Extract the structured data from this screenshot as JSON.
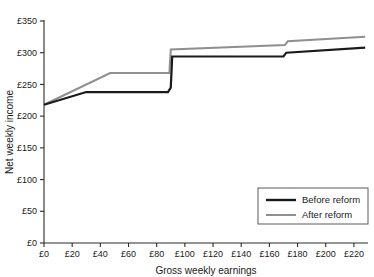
{
  "chart_data": {
    "type": "line",
    "title": "",
    "subtitle": "",
    "xlabel": "Gross weekly earnings",
    "ylabel": "Net weekly income",
    "xlim": [
      0,
      230
    ],
    "ylim": [
      0,
      350
    ],
    "grid": false,
    "legend_position": "bottom-right",
    "x_ticks": [
      0,
      20,
      40,
      60,
      80,
      100,
      120,
      140,
      160,
      180,
      200,
      220
    ],
    "x_tick_labels": [
      "£0",
      "£20",
      "£40",
      "£60",
      "£80",
      "£100",
      "£120",
      "£140",
      "£160",
      "£180",
      "£200",
      "£220"
    ],
    "y_ticks": [
      0,
      50,
      100,
      150,
      200,
      250,
      300,
      350
    ],
    "y_tick_labels": [
      "£0",
      "£50",
      "£100",
      "£150",
      "£200",
      "£250",
      "£300",
      "£350"
    ],
    "currency_symbol": "£",
    "series": [
      {
        "name": "Before reform",
        "color": "#1a1a1a",
        "width": 2.2,
        "points": [
          [
            0,
            218
          ],
          [
            30,
            238
          ],
          [
            88,
            238
          ],
          [
            90,
            245
          ],
          [
            91,
            294
          ],
          [
            170,
            294
          ],
          [
            172,
            300
          ],
          [
            228,
            308
          ]
        ]
      },
      {
        "name": "After reform",
        "color": "#8f8f8f",
        "width": 2.0,
        "points": [
          [
            0,
            218
          ],
          [
            47,
            268
          ],
          [
            89,
            268
          ],
          [
            90,
            305
          ],
          [
            171,
            312
          ],
          [
            173,
            318
          ],
          [
            228,
            325
          ]
        ]
      }
    ],
    "annotations": []
  },
  "legend": {
    "entries": [
      {
        "label": "Before reform",
        "color": "#1a1a1a"
      },
      {
        "label": "After reform",
        "color": "#8f8f8f"
      }
    ]
  },
  "axes": {
    "x_title": "Gross weekly earnings",
    "y_title": "Net weekly income"
  }
}
